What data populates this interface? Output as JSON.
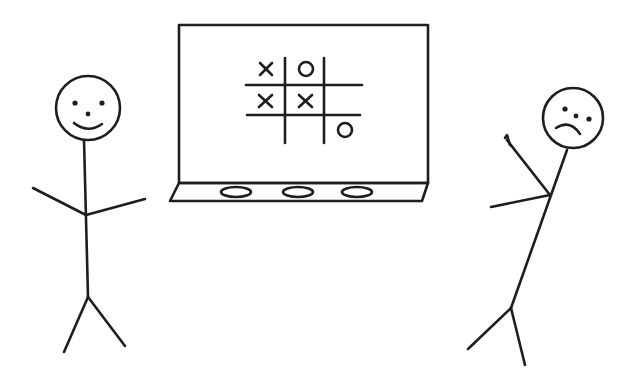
{
  "illustration": {
    "description": "Stick figure illustration: two people at a tic-tac-toe board",
    "ink_color": "#1e1e1e",
    "background_color": "#ffffff"
  },
  "board": {
    "grid": [
      [
        "X",
        "O",
        ""
      ],
      [
        "X",
        "X",
        ""
      ],
      [
        "",
        "",
        "O"
      ]
    ],
    "tray_erasers": 3
  },
  "figures": [
    {
      "id": "left",
      "expression": "smiling",
      "pose": "standing with arms out"
    },
    {
      "id": "right",
      "expression": "frowning",
      "pose": "leaning, one hand raised"
    }
  ]
}
